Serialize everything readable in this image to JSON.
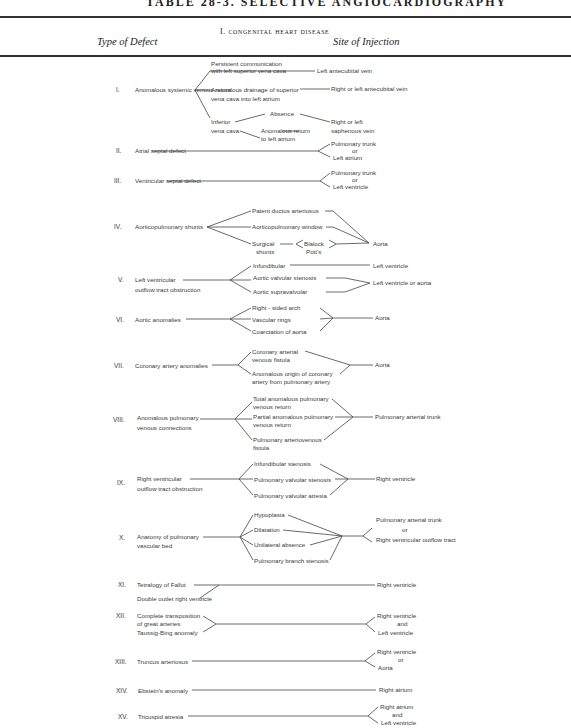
{
  "title": "TABLE 28-3. SELECTIVE ANGIOCARDIOGRAPHY",
  "section_heading": "I. congenital heart disease",
  "columns": {
    "left": "Type of Defect",
    "right": "Site of Injection"
  },
  "rows": [
    {
      "num": "I.",
      "defect": "Anomalous systemic venous return",
      "subtypes": [
        "Persistent communication",
        "with left superior vena cava",
        "Anomalous drainage of superior",
        "vena cava into left atrium",
        "Inferior",
        "vena cava",
        "Absence",
        "Anomalous return",
        "to left atrium"
      ],
      "sites": [
        "Left antecubital vein",
        "Right or left antecubital vein",
        "Right or left",
        "saphenous vein"
      ]
    },
    {
      "num": "II.",
      "defect": "Atrial septal defect",
      "sites": [
        "Pulmonary trunk",
        "or",
        "Left atrium"
      ]
    },
    {
      "num": "III.",
      "defect": "Ventricular septal defect",
      "sites": [
        "Pulmonary trunk",
        "or",
        "Left   ventricle"
      ]
    },
    {
      "num": "IV.",
      "defect": "Aorticopulmonary shunts",
      "subtypes": [
        "Patent ductus arteriosus",
        "Aorticopulmonary window",
        "Surgical",
        "shunts",
        "Blalock",
        "Pott's"
      ],
      "sites": [
        "Aorta"
      ]
    },
    {
      "num": "V.",
      "defect": "Left ventricular",
      "defect2": "outflow tract obstruction",
      "subtypes": [
        "Infundibular",
        "Aortic valvular stenosis",
        "Aortic  supravalvular"
      ],
      "sites": [
        "Left ventricle",
        "Left ventricle or aorta"
      ]
    },
    {
      "num": "VI.",
      "defect": "Aortic anomalies",
      "subtypes": [
        "Right - sided arch",
        "Vascular rings",
        "Coarctation of aorta"
      ],
      "sites": [
        "Aorta"
      ]
    },
    {
      "num": "VII.",
      "defect": "Coronary artery anomalies",
      "subtypes": [
        "Coronary arterial",
        "venous fistula",
        "Anomalous origin of coronary",
        "artery from pulmonary artery"
      ],
      "sites": [
        "Aorta"
      ]
    },
    {
      "num": "VIII.",
      "defect": "Anomalous pulmonary",
      "defect2": "venous connections",
      "subtypes": [
        "Total anomalous pulmonary",
        "venous return",
        "Partial anomalous pulmonary",
        "venous return",
        "Pulmonary arteriovenous",
        "fistula"
      ],
      "sites": [
        "Pulmonary arterial trunk"
      ]
    },
    {
      "num": "IX.",
      "defect": "Right ventricular",
      "defect2": "outflow tract obstruction",
      "subtypes": [
        "Infundibular stenosis",
        "Pulmonary valvular stenosis",
        "Pulmonary valvular atresia"
      ],
      "sites": [
        "Right ventricle"
      ]
    },
    {
      "num": "X.",
      "defect": "Anatomy of pulmonary",
      "defect2": "vascular bed",
      "subtypes": [
        "Hypoplasia",
        "Dilatation",
        "Unilateral absence",
        "Pulmonary branch stenosis"
      ],
      "sites": [
        "Pulmonary arterial trunk",
        "or",
        "Right  ventricular outflow tract"
      ]
    },
    {
      "num": "XI.",
      "defect": "Tetralogy of Fallot",
      "defect2": "Double outlet right  ventricle",
      "sites": [
        "Right ventricle"
      ]
    },
    {
      "num": "XII.",
      "defect": "Complete transposition",
      "defect2": "of great arteries",
      "defect3": "Taussig-Bing anomaly",
      "sites": [
        "Right ventricle",
        "and",
        "Left ventricle"
      ]
    },
    {
      "num": "XIII.",
      "defect": "Truncus arteriosus",
      "sites": [
        "Right ventricle",
        "or",
        "Aorta"
      ]
    },
    {
      "num": "XIV.",
      "defect": "Ebstein's anomaly",
      "sites": [
        "Right atrium"
      ]
    },
    {
      "num": "XV.",
      "defect": "Tricuspid atresia",
      "sites": [
        "Right atrium",
        "and",
        "Left  ventricle"
      ]
    }
  ]
}
